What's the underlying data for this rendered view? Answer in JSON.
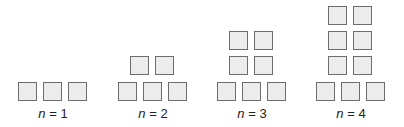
{
  "figures": [
    {
      "label_var": "n",
      "label_eq": " = 1",
      "bottom_row": 3,
      "stack_rows": 0
    },
    {
      "label_var": "n",
      "label_eq": " = 2",
      "bottom_row": 3,
      "stack_rows": 1
    },
    {
      "label_var": "n",
      "label_eq": " = 3",
      "bottom_row": 3,
      "stack_rows": 2
    },
    {
      "label_var": "n",
      "label_eq": " = 4",
      "bottom_row": 3,
      "stack_rows": 3
    }
  ],
  "colors": {
    "square_fill": "#ececec",
    "square_border": "#6d6d6d"
  }
}
